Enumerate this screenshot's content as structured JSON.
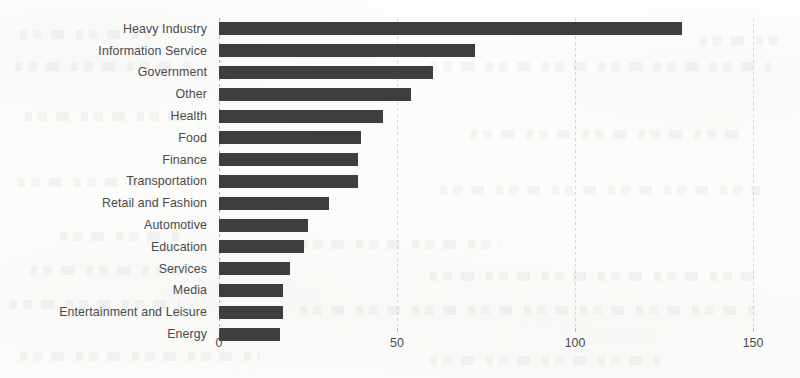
{
  "chart_data": {
    "type": "bar",
    "orientation": "horizontal",
    "title": "",
    "subtitle": "",
    "xlabel": "",
    "ylabel": "",
    "xlim": [
      0,
      150
    ],
    "grid": true,
    "legend": null,
    "bar_color": "#3e3e3e",
    "text_color": "#4a4a4a",
    "background_color": "#fdfdfc",
    "xticks": [
      0,
      50,
      100,
      150
    ],
    "xtick_labels": [
      "0",
      "50",
      "100",
      "150"
    ],
    "categories": [
      "Heavy Industry",
      "Information Service",
      "Government",
      "Other",
      "Health",
      "Food",
      "Finance",
      "Transportation",
      "Retail and Fashion",
      "Automotive",
      "Education",
      "Services",
      "Media",
      "Entertainment and Leisure",
      "Energy"
    ],
    "values": [
      130,
      72,
      60,
      54,
      46,
      40,
      39,
      39,
      31,
      25,
      24,
      20,
      18,
      18,
      17
    ]
  }
}
